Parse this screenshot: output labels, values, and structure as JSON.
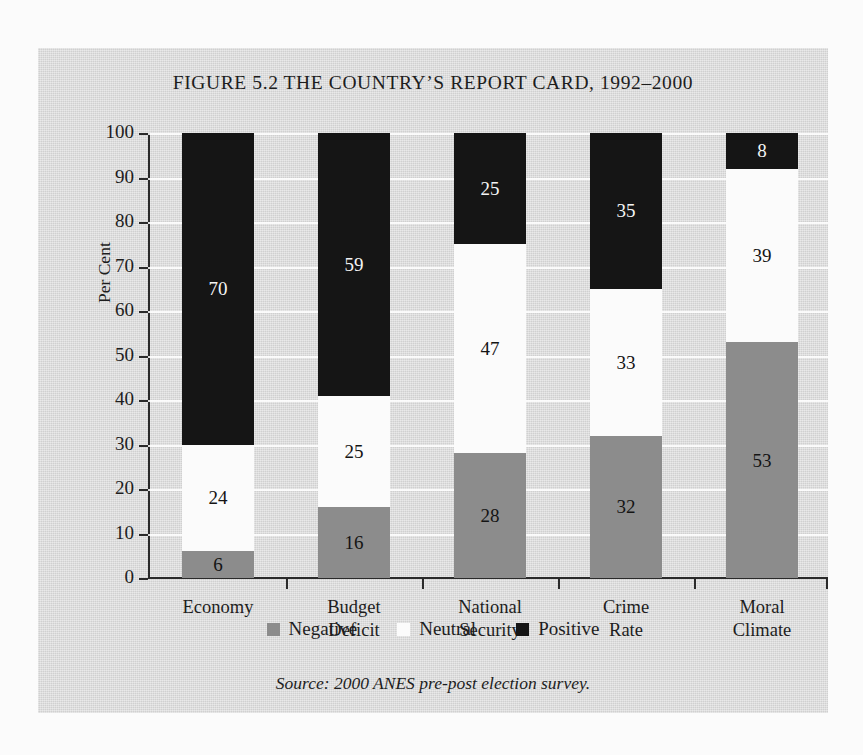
{
  "figure": {
    "title": "FIGURE 5.2 THE COUNTRY’S REPORT CARD, 1992–2000",
    "source_note": "Source: 2000 ANES pre-post election survey."
  },
  "chart_data": {
    "type": "bar",
    "subtype": "stacked-percentage",
    "title": "FIGURE 5.2 THE COUNTRY’S REPORT CARD, 1992–2000",
    "xlabel": "",
    "ylabel": "Per Cent",
    "ylim": [
      0,
      100
    ],
    "ytick_step": 10,
    "yticks": [
      "0",
      "10",
      "20",
      "30",
      "40",
      "50",
      "60",
      "70",
      "80",
      "90",
      "100"
    ],
    "grid": true,
    "grid_axis": "y",
    "legend_position": "bottom",
    "categories": [
      "Economy",
      "Budget Deficit",
      "National\nSecurity",
      "Crime Rate",
      "Moral Climate"
    ],
    "series": [
      {
        "name": "Negative",
        "color": "#8c8c8c",
        "values": [
          6,
          16,
          28,
          32,
          53
        ]
      },
      {
        "name": "Neutral",
        "color": "#fbfbfb",
        "values": [
          24,
          25,
          47,
          33,
          39
        ]
      },
      {
        "name": "Positive",
        "color": "#151515",
        "values": [
          70,
          59,
          25,
          35,
          8
        ]
      }
    ]
  },
  "legend": {
    "items": [
      {
        "label": "Negative",
        "color": "#8c8c8c"
      },
      {
        "label": "Neutral",
        "color": "#fbfbfb"
      },
      {
        "label": "Positive",
        "color": "#151515"
      }
    ]
  }
}
